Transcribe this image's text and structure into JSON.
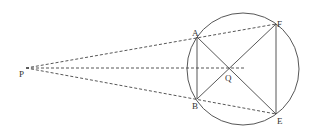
{
  "figure": {
    "points": {
      "P": {
        "label": "P",
        "x": 26,
        "y": 68
      },
      "A": {
        "label": "A",
        "x": 197,
        "y": 37
      },
      "B": {
        "label": "B",
        "x": 197,
        "y": 99
      },
      "E": {
        "label": "E",
        "x": 276,
        "y": 114
      },
      "F": {
        "label": "F",
        "x": 276,
        "y": 24
      },
      "Q": {
        "label": "Q",
        "x": 230,
        "y": 68
      }
    },
    "circle": {
      "cx": 243,
      "cy": 69,
      "r": 56
    },
    "solid_segments": [
      "AB",
      "FE",
      "AE",
      "BF"
    ],
    "dashed_segments": [
      "PF",
      "PE",
      "PQ-extended"
    ],
    "colors": {
      "stroke": "#444444",
      "label": "#333333"
    }
  }
}
